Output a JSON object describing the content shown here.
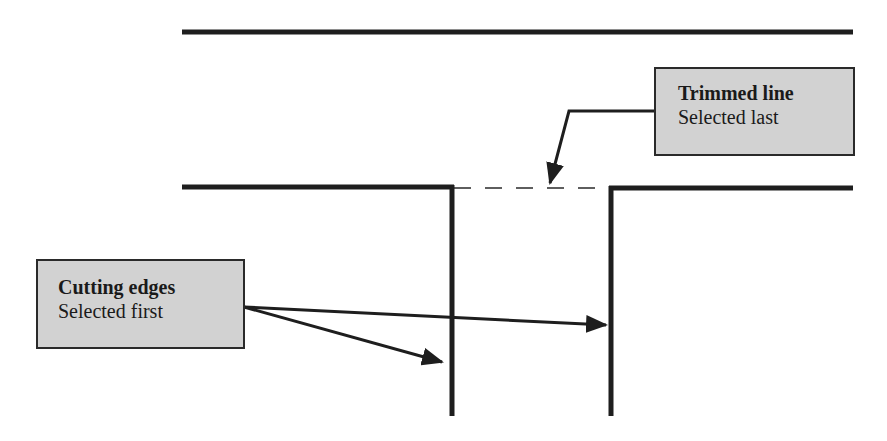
{
  "diagram": {
    "type": "trim-operation-illustration",
    "colors": {
      "line": "#1e1e1e",
      "callout_fill": "#d2d2d2",
      "callout_border": "#2a2a2a",
      "background": "#ffffff"
    },
    "callouts": [
      {
        "id": "trimmed",
        "title": "Trimmed line",
        "subtitle": "Selected last"
      },
      {
        "id": "cutting",
        "title": "Cutting edges",
        "subtitle": "Selected first"
      }
    ],
    "lines": {
      "top_line": {
        "x1": 182,
        "y1": 32,
        "x2": 853,
        "y2": 32
      },
      "middle_left": {
        "x1": 182,
        "y1": 187,
        "x2": 452,
        "y2": 187
      },
      "middle_trimmed_dashed": {
        "x1": 452,
        "y1": 188,
        "x2": 611,
        "y2": 188
      },
      "middle_right": {
        "x1": 611,
        "y1": 188,
        "x2": 853,
        "y2": 188
      },
      "cutting_edge_left": {
        "x1": 452,
        "y1": 187,
        "x2": 452,
        "y2": 416
      },
      "cutting_edge_right": {
        "x1": 611,
        "y1": 188,
        "x2": 611,
        "y2": 416
      }
    }
  }
}
